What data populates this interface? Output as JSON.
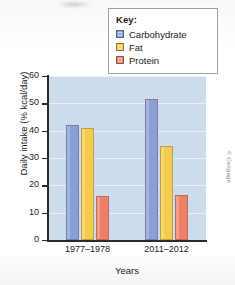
{
  "chart_data": {
    "type": "bar",
    "title": "",
    "xlabel": "Years",
    "ylabel": "Daily intake (% kcal/day)",
    "categories": [
      "1977–1978",
      "2011–2012"
    ],
    "series": [
      {
        "name": "Carbohydrate",
        "values": [
          42.0,
          51.5
        ],
        "color": "#8b9ed6"
      },
      {
        "name": "Fat",
        "values": [
          41.0,
          34.5
        ],
        "color": "#f3cc4e"
      },
      {
        "name": "Protein",
        "values": [
          16.0,
          16.3
        ],
        "color": "#ef8068"
      }
    ],
    "ylim": [
      0,
      60
    ],
    "yticks": [
      0,
      10,
      20,
      30,
      40,
      50,
      60
    ],
    "grid": true,
    "legend_position": "top-right"
  },
  "legend": {
    "title": "Key:",
    "items": [
      {
        "label": "Carbohydrate"
      },
      {
        "label": "Fat"
      },
      {
        "label": "Protein"
      }
    ]
  },
  "credit": "© Cengage"
}
